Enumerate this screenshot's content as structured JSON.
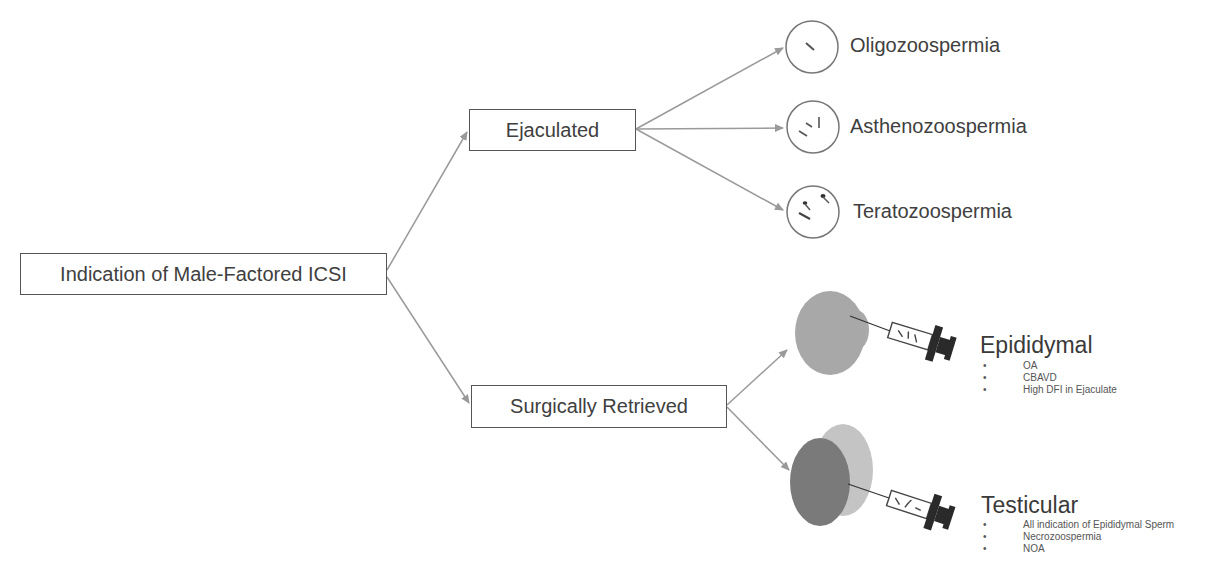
{
  "diagram": {
    "root": {
      "label": "Indication of Male-Factored ICSI"
    },
    "branches": [
      {
        "label": "Ejaculated",
        "children": [
          {
            "label": "Oligozoospermia",
            "icon": "sparse-sperm-circle-icon"
          },
          {
            "label": "Asthenozoospermia",
            "icon": "immotile-sperm-circle-icon"
          },
          {
            "label": "Teratozoospermia",
            "icon": "abnormal-sperm-circle-icon"
          }
        ]
      },
      {
        "label": "Surgically Retrieved",
        "children": [
          {
            "label": "Epididymal",
            "icon": "epididymis-syringe-icon",
            "bullets": [
              "OA",
              "CBAVD",
              "High DFI in Ejaculate"
            ]
          },
          {
            "label": "Testicular",
            "icon": "testis-syringe-icon",
            "bullets": [
              "All indication of Epididymal Sperm",
              "Necrozoospermia",
              "NOA"
            ]
          }
        ]
      }
    ],
    "bullet_glyph": "•",
    "colors": {
      "line": "#9a9a9a",
      "box_border": "#555555",
      "text": "#404040",
      "epididymis_fill": "#a8a8a8",
      "testis_fill": "#7a7a7a",
      "testis_cap_fill": "#c4c4c4",
      "syringe_dark": "#2a2a2a"
    }
  }
}
